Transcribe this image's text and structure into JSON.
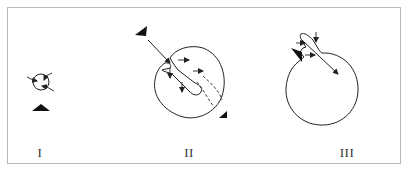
{
  "figure": {
    "panels": [
      {
        "id": "I",
        "label": "I",
        "description": "Small closed circle with small inward arrows; filled triangle marker below"
      },
      {
        "id": "II",
        "label": "II",
        "description": "Larger circle invaginated by a tube entering from upper-left; arrows along tube; dashed lines showing tube path; triangle markers at upper-left and lower-right"
      },
      {
        "id": "III",
        "label": "III",
        "description": "Large circle with narrow neck/loop at upper-left; arrows pointing into neck; long arrow pointing into circle; triangle marker at left"
      }
    ],
    "colors": {
      "stroke": "#222222",
      "frame": "#b8b8b8",
      "background": "#ffffff"
    }
  }
}
